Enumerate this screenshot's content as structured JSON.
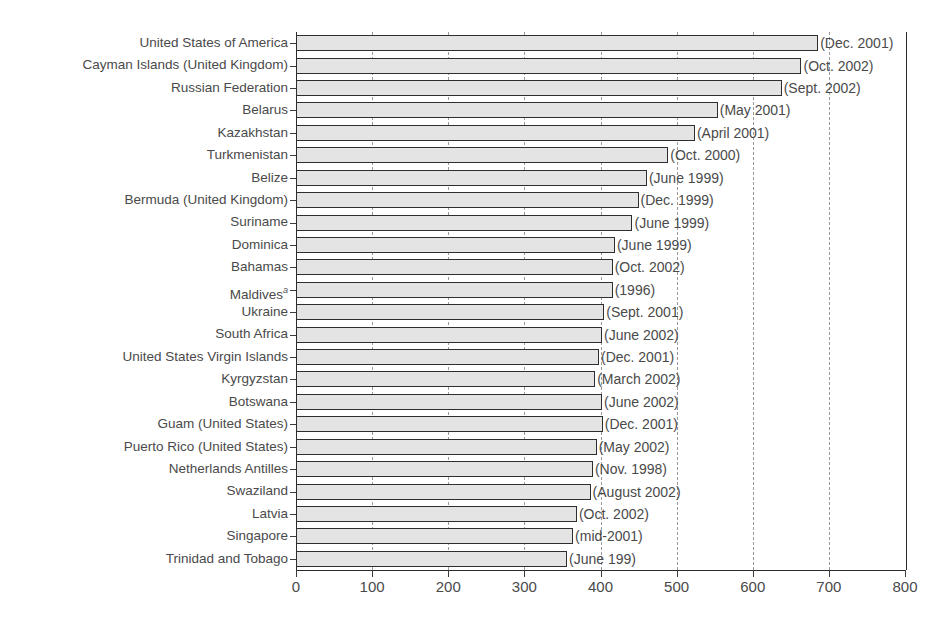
{
  "figure": {
    "clipped_title": "",
    "footnote_marker": "a"
  },
  "chart_data": {
    "type": "bar",
    "orientation": "horizontal",
    "title": "",
    "xlabel": "",
    "ylabel": "",
    "xlim": [
      0,
      800
    ],
    "xticks": [
      0,
      100,
      200,
      300,
      400,
      500,
      600,
      700,
      800
    ],
    "xticklabels": [
      "0",
      "100",
      "200",
      "300",
      "400",
      "500",
      "600",
      "700",
      "800"
    ],
    "grid": "vertical dashed gridlines at 100-unit intervals",
    "legend": "none",
    "categories": [
      "United States of America",
      "Cayman Islands (United Kingdom)",
      "Russian Federation",
      "Belarus",
      "Kazakhstan",
      "Turkmenistan",
      "Belize",
      "Bermuda (United Kingdom)",
      "Suriname",
      "Dominica",
      "Bahamas",
      "Maldives",
      "Ukraine",
      "South Africa",
      "United States Virgin Islands",
      "Kyrgyzstan",
      "Botswana",
      "Guam (United States)",
      "Puerto Rico (United States)",
      "Netherlands Antilles",
      "Swaziland",
      "Latvia",
      "Singapore",
      "Trinidad and Tobago"
    ],
    "values": [
      686,
      664,
      638,
      554,
      524,
      489,
      461,
      450,
      442,
      419,
      416,
      416,
      405,
      402,
      398,
      393,
      402,
      403,
      395,
      390,
      387,
      369,
      364,
      356
    ],
    "annotations": [
      "(Dec. 2001)",
      "(Oct. 2002)",
      "(Sept. 2002)",
      "(May 2001)",
      "(April 2001)",
      "(Oct. 2000)",
      "(June 1999)",
      "(Dec. 1999)",
      "(June 1999)",
      "(June 1999)",
      "(Oct. 2002)",
      "(1996)",
      "(Sept. 2001)",
      "(June 2002)",
      "(Dec. 2001)",
      "(March 2002)",
      "(June 2002)",
      "(Dec. 2001)",
      "(May 2002)",
      "(Nov. 1998)",
      "(August 2002)",
      "(Oct. 2002)",
      "(mid-2001)",
      "(June 199)"
    ],
    "category_superscripts": [
      "",
      "",
      "",
      "",
      "",
      "",
      "",
      "",
      "",
      "",
      "",
      "a",
      "",
      "",
      "",
      "",
      "",
      "",
      "",
      "",
      "",
      "",
      "",
      ""
    ],
    "colors": {
      "bar_fill": "#e4e4e4",
      "bar_border": "#2e2e2e",
      "text": "#4a4a4a",
      "gridline": "#9a9a9a",
      "axis": "#2b2b2b"
    }
  }
}
